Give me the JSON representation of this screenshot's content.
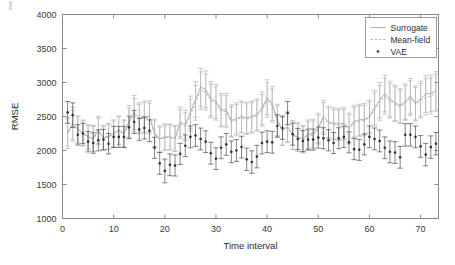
{
  "figure": {
    "background_color": "#ffffff",
    "frame_color": "#8a8a8a"
  },
  "axes": {
    "x_title": "Time interval",
    "y_title": "RMSE",
    "x_ticks": [
      "0",
      "10",
      "20",
      "30",
      "40",
      "50",
      "60",
      "70"
    ],
    "y_ticks": [
      "1000",
      "1500",
      "2000",
      "2500",
      "3000",
      "3500",
      "4000"
    ]
  },
  "legend": {
    "entries": [
      {
        "label": "Surrogate",
        "style": "solid-line",
        "color": "#a8a8a8"
      },
      {
        "label": "Mean-field",
        "style": "dashed-line",
        "color": "#b0b0b0"
      },
      {
        "label": "VAE",
        "style": "dot-marker",
        "color": "#333333"
      }
    ]
  },
  "chart_data": {
    "type": "line",
    "title": "",
    "subtitle": "",
    "xlabel": "Time interval",
    "ylabel": "RMSE",
    "xlim": [
      0,
      73.5
    ],
    "ylim": [
      1000,
      4000
    ],
    "xticks": [
      0,
      10,
      20,
      30,
      40,
      50,
      60,
      70
    ],
    "yticks": [
      1000,
      1500,
      2000,
      2500,
      3000,
      3500,
      4000
    ],
    "grid": false,
    "legend_position": "top-right",
    "errorbars": true,
    "x": [
      1,
      2,
      3,
      4,
      5,
      6,
      7,
      8,
      9,
      10,
      11,
      12,
      13,
      14,
      15,
      16,
      17,
      18,
      19,
      20,
      21,
      22,
      23,
      24,
      25,
      26,
      27,
      28,
      29,
      30,
      31,
      32,
      33,
      34,
      35,
      36,
      37,
      38,
      39,
      40,
      41,
      42,
      43,
      44,
      45,
      46,
      47,
      48,
      49,
      50,
      51,
      52,
      53,
      54,
      55,
      56,
      57,
      58,
      59,
      60,
      61,
      62,
      63,
      64,
      65,
      66,
      67,
      68,
      69,
      70,
      71,
      72,
      73
    ],
    "series": [
      {
        "name": "Surrogate",
        "color": "#a8a8a8",
        "style": "solid-line",
        "values": [
          2250,
          2400,
          2310,
          2260,
          2200,
          2180,
          2300,
          2190,
          2210,
          2250,
          2300,
          2250,
          2430,
          2560,
          2480,
          2500,
          2500,
          2260,
          2170,
          2200,
          2200,
          2180,
          2420,
          2380,
          2560,
          2750,
          2930,
          2900,
          2760,
          2720,
          2600,
          2600,
          2440,
          2470,
          2500,
          2480,
          2500,
          2530,
          2620,
          2780,
          2690,
          2450,
          2300,
          2350,
          2230,
          2200,
          2170,
          2240,
          2250,
          2330,
          2500,
          2420,
          2400,
          2390,
          2400,
          2330,
          2430,
          2450,
          2460,
          2500,
          2630,
          2740,
          2840,
          2760,
          2700,
          2660,
          2720,
          2800,
          2700,
          2760,
          2830,
          2840,
          2880
        ],
        "err": [
          220,
          240,
          200,
          190,
          180,
          190,
          200,
          180,
          190,
          200,
          210,
          200,
          230,
          250,
          220,
          230,
          230,
          200,
          190,
          190,
          190,
          190,
          220,
          210,
          240,
          260,
          280,
          270,
          250,
          250,
          240,
          240,
          230,
          230,
          230,
          230,
          230,
          230,
          240,
          260,
          250,
          230,
          220,
          220,
          210,
          210,
          200,
          210,
          210,
          220,
          240,
          230,
          230,
          230,
          230,
          220,
          230,
          230,
          230,
          240,
          250,
          260,
          270,
          260,
          260,
          250,
          260,
          260,
          250,
          260,
          270,
          270,
          280
        ]
      },
      {
        "name": "Mean-field",
        "color": "#b0b0b0",
        "style": "dashed-line",
        "values": [
          2280,
          2360,
          2300,
          2250,
          2190,
          2170,
          2280,
          2180,
          2200,
          2240,
          2290,
          2240,
          2400,
          2520,
          2460,
          2480,
          2470,
          2240,
          2160,
          2190,
          2190,
          2170,
          2390,
          2350,
          2520,
          2700,
          2880,
          2860,
          2730,
          2690,
          2580,
          2570,
          2420,
          2450,
          2480,
          2460,
          2480,
          2510,
          2590,
          2740,
          2660,
          2430,
          2290,
          2330,
          2220,
          2190,
          2160,
          2220,
          2230,
          2310,
          2470,
          2400,
          2380,
          2370,
          2380,
          2310,
          2410,
          2430,
          2440,
          2480,
          2600,
          2700,
          2800,
          2730,
          2680,
          2640,
          2700,
          2770,
          2680,
          2730,
          2790,
          2800,
          2850
        ],
        "err": [
          210,
          230,
          195,
          185,
          175,
          185,
          195,
          175,
          185,
          195,
          205,
          195,
          225,
          245,
          215,
          225,
          225,
          195,
          185,
          185,
          185,
          185,
          215,
          205,
          235,
          255,
          275,
          265,
          245,
          245,
          235,
          235,
          225,
          225,
          225,
          225,
          225,
          225,
          235,
          255,
          245,
          225,
          215,
          215,
          205,
          205,
          195,
          205,
          205,
          215,
          235,
          225,
          225,
          225,
          225,
          215,
          225,
          225,
          225,
          235,
          245,
          255,
          265,
          255,
          255,
          245,
          255,
          255,
          245,
          255,
          265,
          265,
          275
        ]
      },
      {
        "name": "VAE",
        "color": "#333333",
        "style": "dot-marker",
        "values": [
          2560,
          2520,
          2230,
          2250,
          2130,
          2110,
          2150,
          2160,
          2100,
          2200,
          2200,
          2200,
          2340,
          2420,
          2310,
          2330,
          2290,
          2040,
          1810,
          1700,
          1790,
          1780,
          1950,
          2070,
          2200,
          2220,
          2170,
          2130,
          1960,
          1880,
          2040,
          2090,
          1980,
          2000,
          2050,
          1870,
          1830,
          1910,
          2110,
          2130,
          2120,
          2360,
          2330,
          2550,
          2240,
          2170,
          2140,
          2160,
          2160,
          2190,
          2180,
          2150,
          2110,
          2180,
          2200,
          2120,
          2020,
          2010,
          2090,
          2200,
          2170,
          2140,
          2040,
          1980,
          1970,
          1900,
          2230,
          2230,
          2200,
          2060,
          1940,
          2050,
          2100
        ],
        "err": [
          160,
          180,
          150,
          150,
          150,
          150,
          155,
          150,
          150,
          155,
          155,
          155,
          165,
          170,
          160,
          160,
          160,
          155,
          160,
          175,
          160,
          155,
          155,
          160,
          160,
          160,
          160,
          160,
          160,
          160,
          160,
          160,
          160,
          160,
          160,
          165,
          165,
          165,
          160,
          160,
          160,
          165,
          165,
          170,
          160,
          155,
          155,
          155,
          155,
          155,
          155,
          155,
          155,
          155,
          155,
          155,
          155,
          155,
          155,
          160,
          160,
          160,
          160,
          160,
          160,
          160,
          165,
          165,
          160,
          160,
          165,
          165,
          165
        ]
      }
    ]
  }
}
